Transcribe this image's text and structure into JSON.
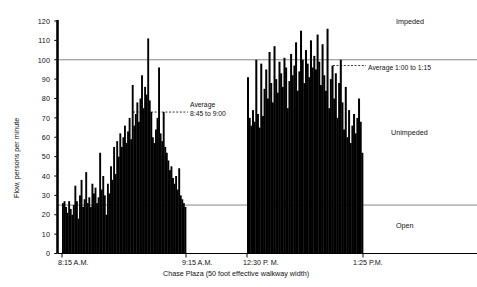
{
  "chart_data": {
    "type": "bar",
    "title": "",
    "subtitle": "",
    "xlabel": "Chase Plaza (50 foot effective walkway width)",
    "ylabel": "Flow, persons per minute",
    "ylim": [
      0,
      120
    ],
    "ytick_step": 10,
    "yticks": [
      0,
      10,
      20,
      30,
      40,
      50,
      60,
      70,
      80,
      90,
      100,
      110,
      120
    ],
    "grid": false,
    "legend_position": "none",
    "bar_color": "#000000",
    "axis_color": "#000000",
    "reference_line_color": "#555555",
    "xticks": [
      {
        "label": "8:15 A.M.",
        "x_px": 62
      },
      {
        "label": "9:15 A.M.",
        "x_px": 186
      },
      {
        "label": "12:30 P. M.",
        "x_px": 247
      },
      {
        "label": "1:25 P.M.",
        "x_px": 363
      }
    ],
    "zone_labels": [
      {
        "text": "Impeded",
        "value_range": "above 100"
      },
      {
        "text": "Unimpeded",
        "value_range": "25 to 100"
      },
      {
        "text": "Open",
        "value_range": "below 25"
      }
    ],
    "reference_lines": [
      {
        "value": 100,
        "style": "solid",
        "label": "impeded-threshold"
      },
      {
        "value": 25,
        "style": "solid",
        "label": "open-threshold"
      }
    ],
    "annotations": [
      {
        "name": "morning-average",
        "line1": "Average",
        "line2": "8:45 to 9:00",
        "value": 73,
        "style": "dashed"
      },
      {
        "name": "afternoon-average",
        "line1": "Average 1:00 to 1:15",
        "line2": "",
        "value": 97,
        "style": "dashed"
      }
    ],
    "series": [
      {
        "name": "Morning flow 8:15 to 9:15 A.M.",
        "start_label": "8:15 A.M.",
        "end_label": "9:15 A.M.",
        "values": [
          26,
          27,
          24,
          21,
          27,
          23,
          20,
          25,
          35,
          27,
          18,
          30,
          38,
          24,
          28,
          42,
          26,
          29,
          24,
          36,
          31,
          34,
          26,
          29,
          52,
          33,
          40,
          30,
          20,
          36,
          31,
          45,
          38,
          55,
          41,
          58,
          50,
          62,
          55,
          60,
          66,
          57,
          63,
          70,
          59,
          87,
          66,
          72,
          78,
          68,
          80,
          92,
          75,
          86,
          82,
          111,
          79,
          73,
          60,
          57,
          64,
          70,
          96,
          62,
          58,
          73,
          55,
          52,
          48,
          43,
          45,
          39,
          36,
          40,
          33,
          44,
          30,
          28,
          26,
          24
        ]
      },
      {
        "name": "Afternoon flow 12:30 to 1:25 P.M.",
        "start_label": "12:30 P. M.",
        "end_label": "1:25 P.M.",
        "values": [
          91,
          70,
          66,
          74,
          68,
          100,
          72,
          65,
          98,
          71,
          85,
          95,
          80,
          104,
          88,
          78,
          107,
          90,
          83,
          99,
          93,
          86,
          101,
          96,
          75,
          89,
          103,
          92,
          97,
          109,
          84,
          94,
          115,
          100,
          88,
          105,
          98,
          91,
          110,
          96,
          102,
          95,
          113,
          99,
          87,
          108,
          92,
          84,
          116,
          75,
          90,
          97,
          80,
          93,
          70,
          88,
          100,
          78,
          64,
          86,
          60,
          74,
          57,
          66,
          72,
          62,
          70,
          80,
          68,
          52
        ]
      }
    ]
  }
}
